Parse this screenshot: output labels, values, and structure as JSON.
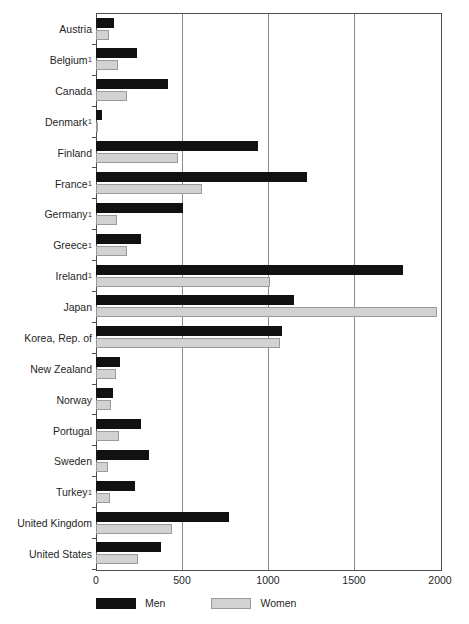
{
  "chart_data": {
    "type": "bar",
    "orientation": "horizontal",
    "title": "",
    "subtitle": "",
    "xlabel": "",
    "ylabel": "",
    "xlim": [
      0,
      2000
    ],
    "ylim": null,
    "grid": true,
    "grid_axis": "x",
    "legend_position": "bottom-left",
    "xticks": [
      0,
      500,
      1000,
      1500,
      2000
    ],
    "xtick_labels": [
      "0",
      "500",
      "1000",
      "1500",
      "2000"
    ],
    "categories": [
      "Austria",
      "Belgium",
      "Canada",
      "Denmark",
      "Finland",
      "France",
      "Germany",
      "Greece",
      "Ireland",
      "Japan",
      "Korea, Rep. of",
      "New Zealand",
      "Norway",
      "Portugal",
      "Sweden",
      "Turkey",
      "United Kingdom",
      "United States"
    ],
    "category_footnotes": [
      "",
      "1",
      "",
      "1",
      "",
      "1",
      "1",
      "1",
      "1",
      "",
      "",
      "",
      "",
      "",
      "",
      "1",
      "",
      ""
    ],
    "series": [
      {
        "name": "Men",
        "color": "#111111",
        "values": [
          105,
          238,
          418,
          35,
          940,
          1225,
          505,
          262,
          1785,
          1150,
          1080,
          140,
          100,
          262,
          310,
          225,
          775,
          375
        ]
      },
      {
        "name": "Women",
        "color": "#d2d2d2",
        "values": [
          75,
          128,
          180,
          8,
          477,
          615,
          122,
          180,
          1010,
          1985,
          1070,
          118,
          85,
          135,
          70,
          80,
          440,
          245
        ]
      }
    ]
  },
  "legend": {
    "items": [
      {
        "label": "Men",
        "swatch": "men-swatch"
      },
      {
        "label": "Women",
        "swatch": "women-swatch"
      }
    ]
  }
}
